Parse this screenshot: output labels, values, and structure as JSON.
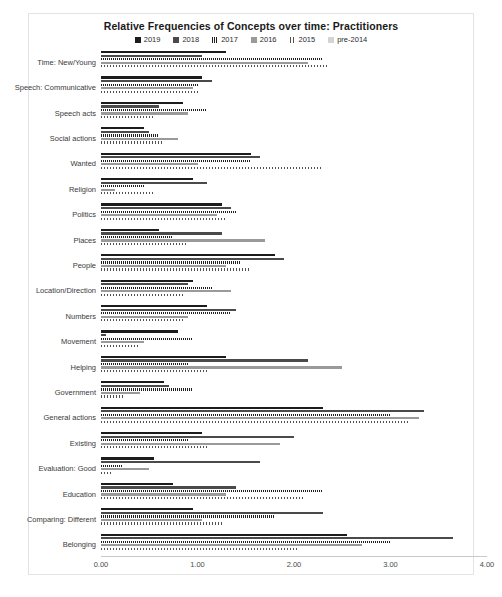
{
  "chart_data": {
    "type": "bar",
    "orientation": "horizontal",
    "title": "Relative Frequencies of Concepts over time: Practitioners",
    "xlabel": "",
    "ylabel": "",
    "xlim": [
      0,
      4
    ],
    "xticks": [
      "0.00",
      "1.00",
      "2.00",
      "3.00",
      "4.00"
    ],
    "xtick_values": [
      0,
      1,
      2,
      3,
      4
    ],
    "grid": false,
    "legend_position": "top",
    "categories": [
      "Time: New/Young",
      "Speech: Communicative",
      "Speech acts",
      "Social actions",
      "Wanted",
      "Religion",
      "Politics",
      "Places",
      "People",
      "Location/Direction",
      "Numbers",
      "Movement",
      "Helping",
      "Government",
      "General actions",
      "Existing",
      "Evaluation: Good",
      "Education",
      "Comparing: Different",
      "Belonging"
    ],
    "series": [
      {
        "name": "2019",
        "color": "#1c1c1c",
        "values": [
          1.3,
          1.05,
          0.85,
          0.45,
          1.55,
          0.95,
          1.25,
          0.6,
          1.8,
          0.95,
          1.1,
          0.8,
          1.3,
          0.65,
          2.3,
          1.05,
          0.55,
          0.75,
          0.95,
          2.55
        ]
      },
      {
        "name": "2018",
        "color": "#4a4a4a",
        "values": [
          1.05,
          1.15,
          0.6,
          0.5,
          1.65,
          1.1,
          1.35,
          1.25,
          1.9,
          0.9,
          1.4,
          0.05,
          2.15,
          0.7,
          3.35,
          2.0,
          1.65,
          1.4,
          2.3,
          3.65
        ]
      },
      {
        "name": "2017",
        "color": "#3d3d3d",
        "values": [
          2.3,
          1.0,
          1.1,
          0.6,
          1.55,
          0.45,
          1.4,
          0.75,
          1.45,
          1.15,
          1.35,
          0.95,
          0.9,
          0.95,
          3.0,
          0.9,
          0.22,
          2.3,
          1.8,
          3.0
        ]
      },
      {
        "name": "2016",
        "color": "#9a9a9a",
        "values": [
          2.15,
          0.95,
          0.9,
          0.8,
          1.0,
          0.15,
          1.2,
          1.7,
          1.3,
          1.35,
          0.9,
          0.45,
          2.5,
          0.4,
          3.3,
          1.85,
          0.5,
          1.3,
          1.05,
          2.7
        ]
      },
      {
        "name": "2015",
        "color": "#8d8d8d",
        "values": [
          2.35,
          1.0,
          0.55,
          0.65,
          2.3,
          0.55,
          1.3,
          0.9,
          1.55,
          0.85,
          0.85,
          0.4,
          1.1,
          0.25,
          3.2,
          1.1,
          0.1,
          2.1,
          1.25,
          2.05
        ]
      },
      {
        "name": "pre-2014",
        "color": "#d4d4d4",
        "values": [
          0.0,
          0.0,
          0.0,
          0.0,
          0.0,
          0.0,
          0.0,
          0.0,
          0.0,
          0.0,
          0.0,
          0.0,
          0.0,
          0.0,
          0.0,
          0.0,
          0.0,
          0.0,
          0.0,
          0.0
        ]
      }
    ]
  }
}
